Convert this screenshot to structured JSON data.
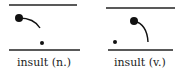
{
  "panels": [
    {
      "label": "insult (n.)",
      "top_line": {
        "x1": 9,
        "x2": 77,
        "y": 5
      },
      "bottom_line": {
        "x1": 9,
        "x2": 80,
        "y": 50
      },
      "stressed_dot": {
        "cx": 19,
        "cy": 18,
        "r": 4
      },
      "unstressed_dot": {
        "cx": 42,
        "cy": 43,
        "r": 2
      },
      "pitch_curve": "M19,18 Q34,18 40,28"
    },
    {
      "label": "insult (v.)",
      "top_line": {
        "x1": 106,
        "x2": 175,
        "y": 8
      },
      "bottom_line": {
        "x1": 108,
        "x2": 173,
        "y": 50
      },
      "stressed_dot": {
        "cx": 134,
        "cy": 21,
        "r": 4
      },
      "unstressed_dot": {
        "cx": 115,
        "cy": 42,
        "r": 2
      },
      "pitch_curve": "M134,21 Q147,24 148,42"
    }
  ],
  "colors": {
    "ink": "#111111",
    "background": "#ffffff"
  }
}
